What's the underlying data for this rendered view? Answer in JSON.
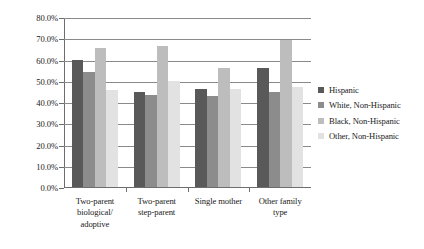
{
  "chart_data": {
    "type": "bar",
    "title": "",
    "subtitle": "",
    "xlabel": "",
    "ylabel": "",
    "ylim": [
      0,
      80
    ],
    "grid": true,
    "legend_position": "right",
    "y_ticks": [
      "0.0%",
      "10.0%",
      "20.0%",
      "30.0%",
      "40.0%",
      "50.0%",
      "60.0%",
      "70.0%",
      "80.0%"
    ],
    "y_tick_values": [
      0,
      10,
      20,
      30,
      40,
      50,
      60,
      70,
      80
    ],
    "categories": [
      "Two-parent biological/ adoptive",
      "Two-parent step-parent",
      "Single mother",
      "Other family type"
    ],
    "category_lines": [
      [
        "Two-parent",
        "biological/",
        "adoptive"
      ],
      [
        "Two-parent",
        "step-parent"
      ],
      [
        "Single mother"
      ],
      [
        "Other family",
        "type"
      ]
    ],
    "series": [
      {
        "name": "Hispanic",
        "color": "#595959",
        "values": [
          59.8,
          44.5,
          46.2,
          56.0
        ]
      },
      {
        "name": "White, Non-Hispanic",
        "color": "#8c8c8c",
        "values": [
          54.2,
          43.3,
          42.8,
          44.5
        ]
      },
      {
        "name": "Black, Non-Hispanic",
        "color": "#bdbdbd",
        "values": [
          65.6,
          66.2,
          55.8,
          69.0
        ]
      },
      {
        "name": "Other, Non-Hispanic",
        "color": "#e2e2e2",
        "values": [
          45.6,
          49.8,
          46.3,
          47.0
        ]
      }
    ]
  },
  "legend": {
    "items": [
      {
        "label": "Hispanic",
        "color": "#595959"
      },
      {
        "label": "White, Non-Hispanic",
        "color": "#8c8c8c"
      },
      {
        "label": "Black, Non-Hispanic",
        "color": "#bdbdbd"
      },
      {
        "label": "Other, Non-Hispanic",
        "color": "#e2e2e2"
      }
    ]
  },
  "colors": {
    "axis": "#6d6d6d",
    "gridline": "#8a8a8a",
    "background": "#ffffff",
    "text": "#1b1b1b"
  }
}
